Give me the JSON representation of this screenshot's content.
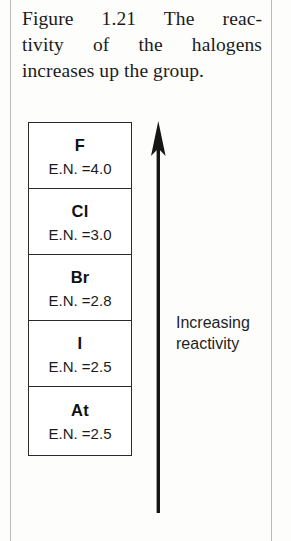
{
  "figure": {
    "caption_lines": [
      "Figure 1.21   The reac-",
      "tivity of the halogens",
      "increases up the group."
    ],
    "caption_number": "Figure 1.21",
    "caption_text": "The reactivity of the halogens increases up the group."
  },
  "table": {
    "rows": [
      {
        "symbol": "F",
        "en_label": "E.N. =4.0",
        "en_value": "4.0"
      },
      {
        "symbol": "Cl",
        "en_label": "E.N. =3.0",
        "en_value": "3.0"
      },
      {
        "symbol": "Br",
        "en_label": "E.N. =2.8",
        "en_value": "2.8"
      },
      {
        "symbol": "I",
        "en_label": "E.N. =2.5",
        "en_value": "2.5"
      },
      {
        "symbol": "At",
        "en_label": "E.N. =2.5",
        "en_value": "2.5"
      }
    ]
  },
  "arrow": {
    "direction": "up",
    "label_lines": [
      "Increasing",
      "reactivity"
    ],
    "label": "Increasing reactivity"
  },
  "colors": {
    "ink": "#1b1b1b",
    "box_border": "#2a2a2a",
    "arrow": "#161616",
    "page_rule": "#b9b9b9",
    "background": "#fdfdfc"
  }
}
